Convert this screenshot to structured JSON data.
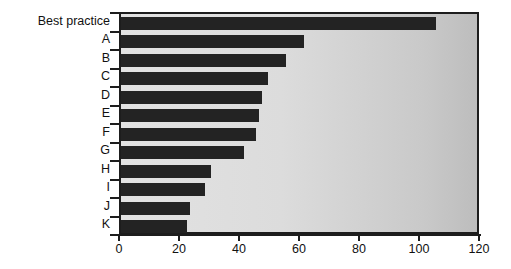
{
  "chart_data": {
    "type": "bar",
    "orientation": "horizontal",
    "title": "",
    "subtitle": "",
    "xlabel": "",
    "ylabel": "",
    "xlim": [
      0,
      120
    ],
    "ylim": null,
    "grid": false,
    "legend": null,
    "legend_position": "none",
    "xticks": [
      0,
      20,
      40,
      60,
      80,
      100,
      120
    ],
    "xtick_labels": [
      "0",
      "20",
      "40",
      "60",
      "80",
      "100",
      "120"
    ],
    "categories": [
      "Best practice",
      "A",
      "B",
      "C",
      "D",
      "E",
      "F",
      "G",
      "H",
      "I",
      "J",
      "K"
    ],
    "values": [
      105,
      61,
      55,
      49,
      47,
      46,
      45,
      41,
      30,
      28,
      23,
      22
    ],
    "bar_color": "#232323",
    "plot_background": "#dcdcdc",
    "axis_color": "#1d1d1d",
    "text_color": "#111111"
  }
}
